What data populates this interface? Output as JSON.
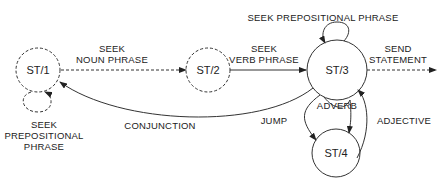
{
  "diagram": {
    "type": "state-transition-network",
    "states": [
      {
        "id": "st1",
        "label": "ST/1",
        "style": "dashed"
      },
      {
        "id": "st2",
        "label": "ST/2",
        "style": "dashed"
      },
      {
        "id": "st3",
        "label": "ST/3",
        "style": "solid"
      },
      {
        "id": "st4",
        "label": "ST/4",
        "style": "solid"
      }
    ],
    "transitions": {
      "st1_self": {
        "line1": "SEEK",
        "line2": "PREPOSITIONAL",
        "line3": "PHRASE",
        "style": "dashed"
      },
      "st1_st2": {
        "line1": "SEEK",
        "line2": "NOUN PHRASE",
        "style": "dashed"
      },
      "st2_st3": {
        "line1": "SEEK",
        "line2": "VERB PHRASE",
        "style": "solid"
      },
      "st3_self": {
        "label": "SEEK PREPOSITIONAL PHRASE",
        "style": "solid"
      },
      "st3_out": {
        "line1": "SEND",
        "line2": "STATEMENT",
        "style": "dashed"
      },
      "st3_st1": {
        "label": "CONJUNCTION",
        "style": "solid"
      },
      "st3_st4_jump": {
        "label": "JUMP",
        "style": "solid"
      },
      "st3_st4_adverb": {
        "label": "ADVERB",
        "style": "solid"
      },
      "st4_st3": {
        "label": "ADJECTIVE",
        "style": "solid"
      }
    }
  }
}
